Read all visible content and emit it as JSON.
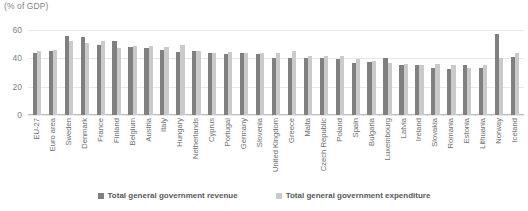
{
  "chart_data": {
    "type": "bar",
    "title": "(% of GDP)",
    "xlabel": "",
    "ylabel": "",
    "ylim": [
      0,
      60
    ],
    "yticks": [
      0,
      20,
      40,
      60
    ],
    "grid": true,
    "legend_position": "bottom",
    "categories": [
      "EU-27",
      "Euro area",
      "Sweden",
      "Denmark",
      "France",
      "Finland",
      "Belgium",
      "Austria",
      "Italy",
      "Hungary",
      "Netherlands",
      "Cyprus",
      "Portugal",
      "Germany",
      "Slovenia",
      "United Kingdom",
      "Greece",
      "Malta",
      "Czech Republic",
      "Poland",
      "Spain",
      "Bulgaria",
      "Luxembourg",
      "Latvia",
      "Ireland",
      "Slovakia",
      "Romania",
      "Estonia",
      "Lithuania",
      "Norway",
      "Iceland"
    ],
    "series": [
      {
        "name": "Total general government revenue",
        "color": "#7f8082",
        "values": [
          44.0,
          44.9,
          55.5,
          55.0,
          49.5,
          52.5,
          48.3,
          47.5,
          46.0,
          44.5,
          45.5,
          43.5,
          43.0,
          43.5,
          43.0,
          40.0,
          40.0,
          40.0,
          40.0,
          39.5,
          37.0,
          37.5,
          40.0,
          35.5,
          35.0,
          33.5,
          32.5,
          35.5,
          33.5,
          57.0,
          41.0
        ]
      },
      {
        "name": "Total general government expenditure",
        "color": "#c9cacb",
        "values": [
          45.0,
          46.0,
          52.5,
          51.0,
          52.5,
          47.5,
          48.5,
          48.5,
          48.0,
          49.5,
          45.5,
          43.5,
          44.5,
          43.5,
          44.0,
          43.5,
          45.5,
          41.5,
          42.0,
          42.0,
          39.5,
          38.0,
          37.0,
          36.0,
          35.5,
          36.0,
          35.5,
          33.5,
          35.5,
          40.0,
          43.5
        ]
      }
    ]
  },
  "legend": {
    "items": [
      {
        "label": "Total general government revenue",
        "series": "revenue"
      },
      {
        "label": "Total general government expenditure",
        "series": "expenditure"
      }
    ]
  }
}
